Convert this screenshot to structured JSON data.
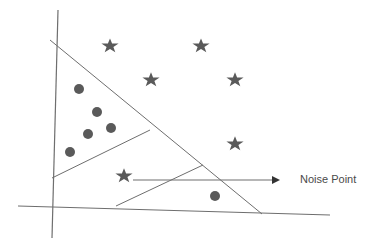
{
  "diagram": {
    "title": "",
    "annotation": "Noise Point",
    "colors": {
      "line": "#6e6e6e",
      "marker": "#5a5a5a",
      "text": "#4a4a4a"
    },
    "axes": {
      "y_axis": {
        "x1": 58,
        "y1": 10,
        "x2": 52,
        "y2": 238
      },
      "x_axis": {
        "x1": 18,
        "y1": 206,
        "x2": 330,
        "y2": 215
      }
    },
    "boundaries": [
      {
        "x1": 50,
        "y1": 40,
        "x2": 262,
        "y2": 214
      },
      {
        "x1": 52,
        "y1": 178,
        "x2": 150,
        "y2": 130
      },
      {
        "x1": 116,
        "y1": 206,
        "x2": 203,
        "y2": 165
      }
    ],
    "arrow": {
      "x1": 133,
      "y1": 180,
      "x2": 280,
      "y2": 180
    },
    "circles": [
      {
        "x": 79,
        "y": 89
      },
      {
        "x": 97,
        "y": 112
      },
      {
        "x": 88,
        "y": 134
      },
      {
        "x": 111,
        "y": 128
      },
      {
        "x": 70,
        "y": 152
      },
      {
        "x": 215,
        "y": 196
      }
    ],
    "stars": [
      {
        "x": 110,
        "y": 46
      },
      {
        "x": 201,
        "y": 46
      },
      {
        "x": 151,
        "y": 80
      },
      {
        "x": 235,
        "y": 80
      },
      {
        "x": 235,
        "y": 144
      },
      {
        "x": 124,
        "y": 176
      }
    ]
  }
}
